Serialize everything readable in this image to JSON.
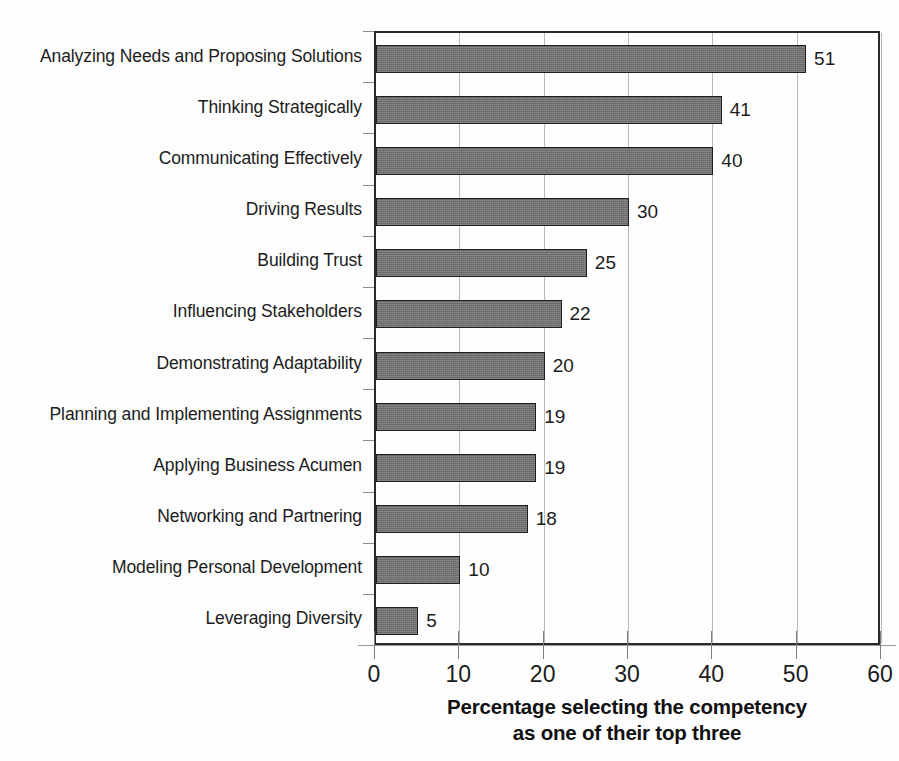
{
  "chart_data": {
    "type": "bar",
    "orientation": "horizontal",
    "title": "",
    "xlabel": "Percentage selecting the competency as one of their top three",
    "ylabel": "",
    "xlim": [
      0,
      60
    ],
    "xticks": [
      0,
      10,
      20,
      30,
      40,
      50,
      60
    ],
    "grid": true,
    "legend": false,
    "categories": [
      "Analyzing Needs and Proposing Solutions",
      "Thinking Strategically",
      "Communicating Effectively",
      "Driving Results",
      "Building Trust",
      "Influencing Stakeholders",
      "Demonstrating Adaptability",
      "Planning and Implementing Assignments",
      "Applying Business Acumen",
      "Networking and Partnering",
      "Modeling Personal Development",
      "Leveraging Diversity"
    ],
    "values": [
      51,
      41,
      40,
      30,
      25,
      22,
      20,
      19,
      19,
      18,
      10,
      5
    ],
    "bar_color": "#6f6f6f",
    "bar_border_color": "#1e1e1e",
    "gridline_color": "#b9b9b9",
    "axis_color": "#2a2a2a",
    "text_color": "#1c1c1c"
  },
  "caption": {
    "line1": "Percentage selecting the competency",
    "line2": "as one of their top three"
  }
}
